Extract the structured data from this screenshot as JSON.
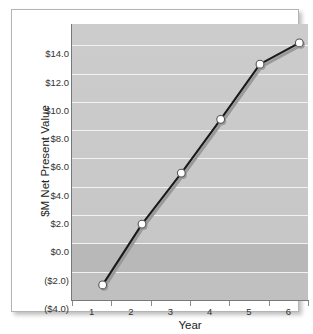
{
  "chart_data": {
    "type": "line",
    "title": "",
    "xlabel": "Year",
    "ylabel": "$M Net Present Value",
    "x": [
      1,
      2,
      3,
      4,
      5,
      6
    ],
    "categories": [
      "1",
      "2",
      "3",
      "4",
      "5",
      "6"
    ],
    "values": [
      -2.3,
      2.0,
      5.6,
      9.4,
      13.3,
      14.8
    ],
    "series": [
      {
        "name": "Net Present Value",
        "values": [
          -2.3,
          2.0,
          5.6,
          9.4,
          13.3,
          14.8
        ]
      }
    ],
    "xlim": [
      0.5,
      6.5
    ],
    "ylim": [
      -4.0,
      15.5
    ],
    "ytick_values": [
      14.0,
      12.0,
      10.0,
      8.0,
      6.0,
      4.0,
      2.0,
      0.0,
      -2.0,
      -4.0
    ],
    "ytick_labels": [
      "$14.0",
      "$12.0",
      "$10.0",
      "$8.0",
      "$6.0",
      "$4.0",
      "$2.0",
      "$0.0",
      "($2.0)",
      "($4.0)"
    ],
    "xtick_labels": [
      "1",
      "2",
      "3",
      "4",
      "5",
      "6"
    ],
    "grid": true,
    "legend": false,
    "legend_position": "none",
    "colors": {
      "plot_background": "#c9c9c9",
      "negative_band": "#b8b8b8",
      "gridline": "#f2f2f2",
      "line": "#1a1a1a",
      "line_shadow": "#9a9a9a",
      "marker_fill": "#ffffff",
      "marker_edge": "#555555",
      "axis": "#787878",
      "frame": "#b4b4b4",
      "text": "#333333"
    }
  }
}
